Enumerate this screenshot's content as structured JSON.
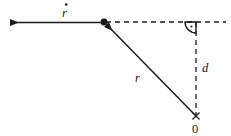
{
  "figure": {
    "type": "geometry-diagram",
    "background_color": "#ffffff",
    "stroke_color": "#1a1a1a",
    "width": 231,
    "height": 136
  },
  "labels": {
    "velocity": "r",
    "velocity_overdot": "˙",
    "radius": "r",
    "distance": "d",
    "origin": "0"
  },
  "geometry": {
    "junction_point": {
      "x": 104,
      "y": 22
    },
    "origin_point": {
      "x": 196,
      "y": 116
    },
    "corner_point": {
      "x": 196,
      "y": 22
    },
    "arrow_tip": {
      "x": 8,
      "y": 23
    },
    "dashed_right_end": {
      "x": 226,
      "y": 22
    },
    "right_angle_marker": {
      "radius": 11,
      "center": {
        "x": 196,
        "y": 22
      },
      "dot_offset": {
        "x": -4,
        "y": 4
      }
    }
  },
  "elements": {
    "velocity_arrow_name": "velocity-vector-arrow",
    "radius_arrow_name": "radius-vector-arrow",
    "horizontal_dashed_name": "horizontal-dashed-line",
    "vertical_dashed_name": "vertical-dashed-line",
    "junction_dot_name": "junction-point-marker",
    "origin_cross_name": "origin-cross-marker",
    "right_angle_name": "right-angle-marker"
  }
}
